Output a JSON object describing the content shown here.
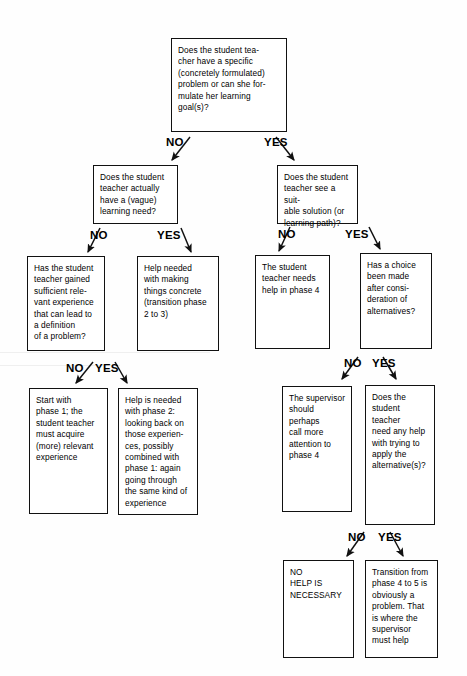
{
  "diagram": {
    "type": "decision-tree-flowchart",
    "labels": {
      "no": "NO",
      "yes": "YES"
    },
    "nodes": {
      "q_root": "Does the student tea-\ncher have a specific\n(concretely formulated)\nproblem or can she for-\nmulate her learning\ngoal(s)?",
      "q_vague_need": "Does the student\nteacher actually\nhave a (vague)\nlearning need?",
      "q_suitable_solution": "Does the student\nteacher see a suit-\nable solution (or\nlearning path)?",
      "q_sufficient_experience": "Has the student\nteacher gained\nsufficient rele-\nvant experience\nthat can lead to\na definition\nof a problem?",
      "a_help_concrete": "Help needed\nwith making\nthings concrete\n(transition phase\n2 to 3)",
      "a_needs_help_phase4": "The student\nteacher needs\nhelp in phase 4",
      "q_choice_made": "Has a choice\nbeen made\nafter consi-\nderation of\nalternatives?",
      "a_start_phase1": "Start with\nphase 1; the\nstudent teacher\nmust acquire\n(more) relevant\nexperience",
      "a_help_phase2": "Help is needed\nwith phase 2:\nlooking back on\nthose experien-\nces, possibly\ncombined with\nphase 1: again\ngoing through\nthe same kind of\nexperience",
      "a_supervisor_attention": "The supervisor\nshould perhaps\ncall more\nattention to\nphase 4",
      "q_need_help_apply": "Does the\nstudent teacher\nneed any help\nwith trying to\napply the\nalternative(s)?",
      "a_no_help_necessary": "NO\nHELP IS\nNECESSARY",
      "a_transition_4_to_5": "Transition from\nphase 4 to 5 is\nobviously a\nproblem. That\nis where the\nsupervisor\nmust help"
    },
    "edge_labels": {
      "root_no": "NO",
      "root_yes": "YES",
      "vague_no": "NO",
      "vague_yes": "YES",
      "solution_no": "NO",
      "solution_yes": "YES",
      "experience_no": "NO",
      "experience_yes": "YES",
      "choice_no": "NO",
      "choice_yes": "YES",
      "apply_no": "NO",
      "apply_yes": "YES"
    }
  }
}
